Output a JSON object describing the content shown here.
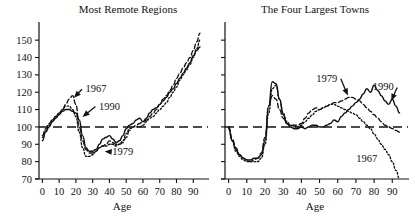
{
  "figure": {
    "axis_label": "Age",
    "y_ticks": [
      70,
      80,
      90,
      100,
      110,
      120,
      130,
      140,
      150
    ],
    "x_ticks": [
      0,
      10,
      20,
      30,
      40,
      50,
      60,
      70,
      80,
      90
    ],
    "reference_line_value": 100,
    "ink_color": "#111111",
    "background_color": "#ffffff"
  },
  "chart_data": [
    {
      "type": "line",
      "title": "Most Remote Regions",
      "xlabel": "Age",
      "ylabel": "",
      "xlim": [
        -2,
        97
      ],
      "ylim": [
        70,
        157
      ],
      "grid": false,
      "legend": "inline-annotations",
      "reference_line": 100,
      "x": [
        0,
        2,
        4,
        6,
        8,
        10,
        12,
        14,
        16,
        18,
        20,
        22,
        24,
        26,
        28,
        30,
        32,
        34,
        36,
        38,
        40,
        42,
        44,
        46,
        48,
        50,
        52,
        54,
        56,
        58,
        60,
        62,
        64,
        66,
        68,
        70,
        72,
        74,
        76,
        78,
        80,
        82,
        84,
        86,
        88,
        90,
        92,
        94
      ],
      "series": [
        {
          "name": "1967",
          "style": "dashed",
          "values": [
            95,
            99,
            102,
            104,
            106,
            108,
            110,
            113,
            116,
            118,
            113,
            100,
            92,
            87,
            85,
            85,
            86,
            88,
            89,
            90,
            92,
            91,
            90,
            90,
            91,
            94,
            98,
            100,
            101,
            102,
            103,
            104,
            106,
            108,
            110,
            113,
            116,
            118,
            121,
            124,
            128,
            131,
            134,
            137,
            140,
            144,
            149,
            154
          ]
        },
        {
          "name": "1990",
          "style": "solid",
          "values": [
            92,
            97,
            100,
            103,
            105,
            107,
            109,
            110,
            110,
            109,
            108,
            104,
            95,
            88,
            86,
            86,
            87,
            90,
            93,
            94,
            95,
            93,
            91,
            92,
            95,
            99,
            101,
            102,
            104,
            105,
            103,
            105,
            108,
            110,
            111,
            113,
            115,
            117,
            120,
            122,
            125,
            128,
            131,
            134,
            137,
            141,
            144,
            146
          ]
        },
        {
          "name": "1979",
          "style": "dotted",
          "values": [
            94,
            98,
            101,
            104,
            106,
            108,
            110,
            112,
            112,
            110,
            106,
            97,
            88,
            83,
            83,
            84,
            86,
            88,
            89,
            89,
            90,
            90,
            89,
            90,
            92,
            96,
            99,
            100,
            100,
            100,
            101,
            103,
            105,
            106,
            108,
            110,
            112,
            114,
            117,
            120,
            123,
            127,
            130,
            133,
            136,
            140,
            145,
            150
          ]
        }
      ],
      "annotations": [
        {
          "label": "1967",
          "x_text": 32,
          "y_text": 120,
          "x_point": 18,
          "y_point": 116
        },
        {
          "label": "1990",
          "x_text": 40,
          "y_text": 110,
          "x_point": 23,
          "y_point": 105
        },
        {
          "label": "1979",
          "x_text": 48,
          "y_text": 84,
          "x_point": 36,
          "y_point": 86
        }
      ]
    },
    {
      "type": "line",
      "title": "The Four Largest Towns",
      "xlabel": "Age",
      "ylabel": "",
      "xlim": [
        -2,
        97
      ],
      "ylim": [
        70,
        157
      ],
      "grid": false,
      "legend": "inline-annotations",
      "reference_line": 100,
      "x": [
        0,
        2,
        4,
        6,
        8,
        10,
        12,
        14,
        16,
        18,
        20,
        22,
        24,
        26,
        28,
        30,
        32,
        34,
        36,
        38,
        40,
        42,
        44,
        46,
        48,
        50,
        52,
        54,
        56,
        58,
        60,
        62,
        64,
        66,
        68,
        70,
        72,
        74,
        76,
        78,
        80,
        82,
        84,
        86,
        88,
        90,
        92,
        94
      ],
      "series": [
        {
          "name": "1967",
          "style": "dotted",
          "values": [
            100,
            92,
            86,
            83,
            81,
            80,
            80,
            80,
            80,
            82,
            90,
            108,
            122,
            124,
            116,
            108,
            103,
            101,
            100,
            100,
            101,
            103,
            105,
            107,
            109,
            110,
            111,
            112,
            113,
            113,
            112,
            111,
            110,
            109,
            108,
            107,
            105,
            103,
            101,
            99,
            96,
            93,
            90,
            87,
            84,
            80,
            75,
            70
          ]
        },
        {
          "name": "1990",
          "style": "solid",
          "values": [
            99,
            92,
            87,
            84,
            82,
            81,
            81,
            82,
            82,
            84,
            92,
            112,
            126,
            125,
            116,
            107,
            102,
            100,
            99,
            99,
            100,
            99,
            100,
            101,
            101,
            100,
            100,
            101,
            102,
            104,
            103,
            106,
            108,
            110,
            112,
            114,
            116,
            119,
            122,
            120,
            124,
            121,
            118,
            115,
            113,
            116,
            112,
            108
          ]
        },
        {
          "name": "1979",
          "style": "dashed",
          "values": [
            100,
            93,
            88,
            84,
            82,
            81,
            80,
            81,
            82,
            85,
            94,
            112,
            118,
            116,
            110,
            105,
            102,
            101,
            101,
            101,
            102,
            105,
            108,
            110,
            111,
            110,
            111,
            112,
            113,
            114,
            114,
            115,
            116,
            117,
            117,
            116,
            115,
            113,
            111,
            109,
            107,
            105,
            103,
            101,
            100,
            99,
            98,
            97
          ]
        }
      ],
      "annotations": [
        {
          "label": "1979",
          "x_text": 54,
          "y_text": 126,
          "x_point": 66,
          "y_point": 117
        },
        {
          "label": "1990",
          "x_text": 85,
          "y_text": 121,
          "x_point": 89,
          "y_point": 114
        },
        {
          "label": "1967",
          "x_text": 76,
          "y_text": 80,
          "x_point": 76,
          "y_point": 80,
          "no_arrow": true
        }
      ]
    }
  ]
}
